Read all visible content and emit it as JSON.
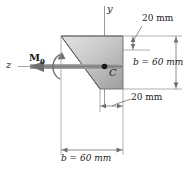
{
  "figure": {
    "kind": "engineering-cross-section-diagram",
    "axes": {
      "y_label": "y",
      "z_label": "z"
    },
    "centroid": {
      "label": "C"
    },
    "load": {
      "moment_label": "M",
      "moment_subscript": "0"
    },
    "dimensions": {
      "top_right": "20 mm",
      "right_height": "b = 60 mm",
      "bottom_right": "20 mm",
      "bottom_width": "b = 60 mm"
    },
    "colors": {
      "fill_light": "#d9d9d9",
      "fill_dark": "#9a9a9a",
      "outline": "#4a4a4a",
      "axis": "#8c8c8c",
      "text": "#1a1a1a",
      "arrow": "#6e6e6e"
    }
  }
}
